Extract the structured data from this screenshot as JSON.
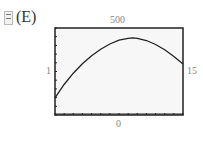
{
  "option_label": "(E)",
  "icon": "calculator-graph-icon",
  "window": {
    "ymax_label": "500",
    "ymin_label": "0",
    "xmin_label": "1",
    "xmax_label": "15"
  },
  "chart_data": {
    "type": "line",
    "title": "",
    "xlabel": "",
    "ylabel": "",
    "xlim": [
      1,
      15
    ],
    "ylim": [
      0,
      500
    ],
    "grid": false,
    "tick_marks": true,
    "series": [
      {
        "name": "curve",
        "x": [
          1,
          2,
          3,
          4,
          5,
          6,
          7,
          8,
          9,
          9.5,
          10,
          11,
          12,
          13,
          14,
          15
        ],
        "y": [
          98,
          175,
          240,
          295,
          340,
          378,
          408,
          430,
          441,
          443,
          441,
          428,
          405,
          375,
          337,
          293
        ]
      }
    ],
    "colors": {
      "curve": "#222222",
      "frame": "#222222",
      "background": "#f7f7f7"
    }
  }
}
